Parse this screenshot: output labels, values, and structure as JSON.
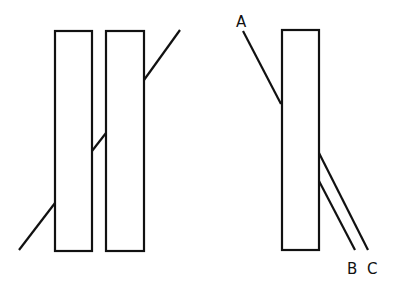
{
  "diagram": {
    "left_figure": {
      "slabs": [
        {
          "x": 55,
          "y": 31,
          "w": 37,
          "h": 220
        },
        {
          "x": 106,
          "y": 31,
          "w": 38,
          "h": 220
        }
      ],
      "ray_segments": [
        {
          "x1": 19,
          "y1": 250,
          "x2": 55,
          "y2": 203
        },
        {
          "x1": 92,
          "y1": 151,
          "x2": 106,
          "y2": 133
        },
        {
          "x1": 144,
          "y1": 80,
          "x2": 180,
          "y2": 30
        }
      ]
    },
    "right_figure": {
      "slab": {
        "x": 282,
        "y": 30,
        "w": 37,
        "h": 220
      },
      "rays": [
        {
          "label": "A",
          "x1": 243,
          "y1": 31,
          "x2": 281,
          "y2": 104
        },
        {
          "label": "B",
          "x1": 319,
          "y1": 181,
          "x2": 355,
          "y2": 250
        },
        {
          "label": "C",
          "x1": 319,
          "y1": 153,
          "x2": 368,
          "y2": 250
        }
      ],
      "labels": [
        {
          "text": "A",
          "x": 236,
          "y": 27
        },
        {
          "text": "B",
          "x": 347,
          "y": 274
        },
        {
          "text": "C",
          "x": 367,
          "y": 274
        }
      ]
    },
    "stroke_color": "#111111"
  }
}
